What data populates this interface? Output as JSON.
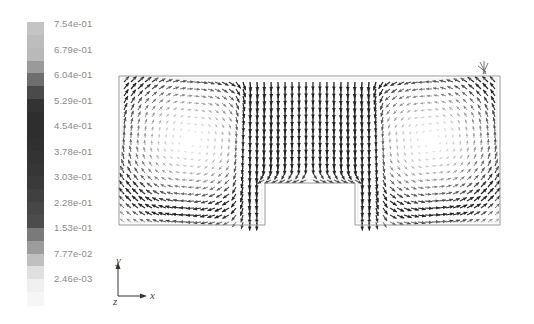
{
  "chart_data": {
    "type": "vector-field",
    "title": "",
    "variable": "Velocity magnitude (colored vectors, grayscale)",
    "colorbar": {
      "min": 0.00246,
      "max": 0.754,
      "tick_labels": [
        "7.54e-01",
        "6.79e-01",
        "6.04e-01",
        "5.29e-01",
        "4.54e-01",
        "3.78e-01",
        "3.03e-01",
        "2.28e-01",
        "1.53e-01",
        "7.77e-02",
        "2.46e-03"
      ],
      "band_colors_top_to_bottom": [
        "#c4c4c4",
        "#bdbdbd",
        "#b9b9b9",
        "#9a9a9a",
        "#6e6e6e",
        "#4a4a4a",
        "#333333",
        "#2e2e2e",
        "#2e2e2e",
        "#303030",
        "#333333",
        "#363636",
        "#3a3a3a",
        "#404040",
        "#474747",
        "#4c4c4c",
        "#7a7a7a",
        "#9c9c9c",
        "#c0c0c0",
        "#e0e0e0",
        "#f0f0f0",
        "#f6f6f6"
      ]
    },
    "domain": {
      "outer_box": {
        "x1": 119,
        "y1": 76,
        "x2": 500,
        "y2": 225
      },
      "notch": {
        "x1": 265,
        "x2": 355,
        "top": 183
      },
      "description": "Cavity with a raised rectangular block on the bottom wall; two counter-rotating vortices with strong downward jet at center"
    },
    "flow": {
      "left_vortex": {
        "cx": 190,
        "cy": 140,
        "rotation": "counterclockwise"
      },
      "right_vortex": {
        "cx": 430,
        "cy": 140,
        "rotation": "clockwise"
      },
      "central_jet": {
        "direction": "down",
        "x_range": [
          245,
          375
        ]
      }
    },
    "axes": {
      "x_label": "x",
      "y_label": "y",
      "z_label": "z"
    }
  }
}
